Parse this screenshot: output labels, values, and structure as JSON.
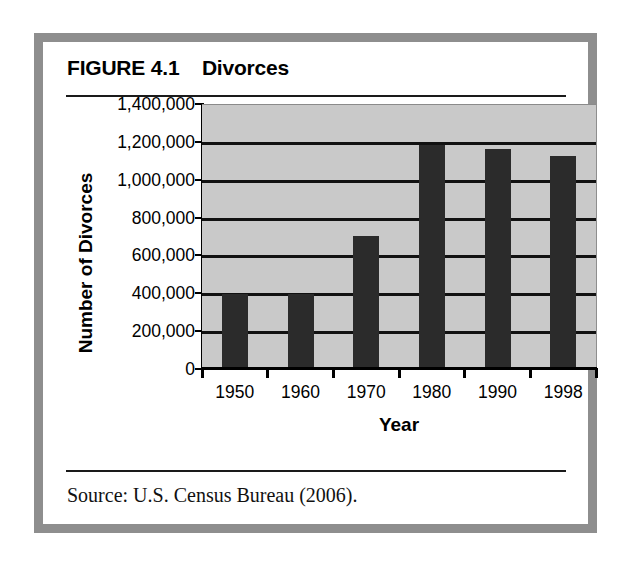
{
  "figure": {
    "label": "FIGURE 4.1",
    "title": "Divorces",
    "heading": "FIGURE 4.1    Divorces",
    "source": "Source: U.S. Census Bureau (2006).",
    "frame_color": "#8e8e8e",
    "plot_background": "#c9c9c9",
    "bar_color": "#2b2b2b",
    "gridline_color": "#111111"
  },
  "chart_data": {
    "type": "bar",
    "title": "Divorces",
    "xlabel": "Year",
    "ylabel": "Number of Divorces",
    "categories": [
      "1950",
      "1960",
      "1970",
      "1980",
      "1990",
      "1998"
    ],
    "values": [
      400000,
      400000,
      710000,
      1190000,
      1170000,
      1130000
    ],
    "ylim": [
      0,
      1400000
    ],
    "ytick_values": [
      0,
      200000,
      400000,
      600000,
      800000,
      1000000,
      1200000,
      1400000
    ],
    "ytick_labels": [
      "0",
      "200,000",
      "400,000",
      "600,000",
      "800,000",
      "1,000,000",
      "1,200,000",
      "1,400,000"
    ],
    "grid": true,
    "grid_axis": "y",
    "legend": null,
    "legend_position": "none"
  }
}
